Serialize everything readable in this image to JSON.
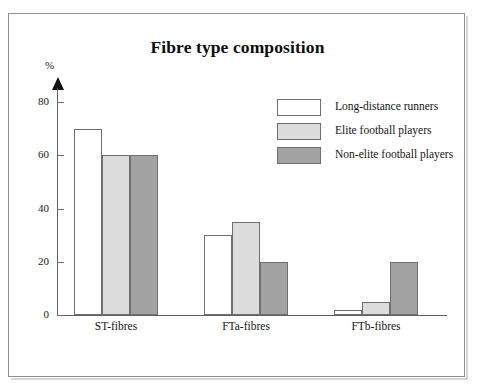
{
  "scan_artifact": {
    "text": "˙   ˙        ˙           ˙  ˙"
  },
  "chart_data": {
    "type": "bar",
    "title": "Fibre type composition",
    "xlabel": "",
    "ylabel": "%",
    "categories": [
      "ST-fibres",
      "FTa-fibres",
      "FTb-fibres"
    ],
    "series": [
      {
        "name": "Long-distance runners",
        "values": [
          70,
          30,
          2
        ],
        "color": "#ffffff"
      },
      {
        "name": "Elite football players",
        "values": [
          60,
          35,
          5
        ],
        "color": "#dcdcdc"
      },
      {
        "name": "Non-elite football players",
        "values": [
          60,
          20,
          20
        ],
        "color": "#a3a3a3"
      }
    ],
    "ylim": [
      0,
      88
    ],
    "yticks": [
      0,
      20,
      40,
      60,
      80
    ],
    "ytick_labels": [
      "0",
      "20",
      "40",
      "60",
      "80"
    ],
    "grid": false,
    "legend_position": "upper right",
    "axis_color": "#6f6f6f",
    "bar_border_color": "#6f6f6f",
    "frame_color": "#8e8e8e"
  }
}
